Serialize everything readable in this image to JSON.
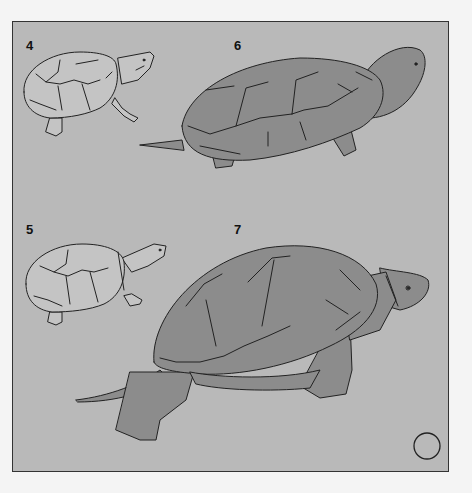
{
  "figure": {
    "panels": [
      {
        "id": "4",
        "label": "4",
        "style": "outline",
        "description": "small turtle, line drawing, head up right"
      },
      {
        "id": "5",
        "label": "5",
        "style": "outline",
        "description": "small turtle, line drawing, head right"
      },
      {
        "id": "6",
        "label": "6",
        "style": "filled",
        "description": "large shaded turtle, head raised right"
      },
      {
        "id": "7",
        "label": "7",
        "style": "filled",
        "description": "large shaded turtle, walking right"
      }
    ],
    "marker": {
      "shape": "circle"
    }
  },
  "colors": {
    "page": "#f4f4f4",
    "panel_bg": "#b9b9b9",
    "turtle_fill": "#8c8c8c",
    "turtle_dark": "#808080",
    "outline_fill": "#c4c4c4",
    "stroke": "#222222"
  }
}
